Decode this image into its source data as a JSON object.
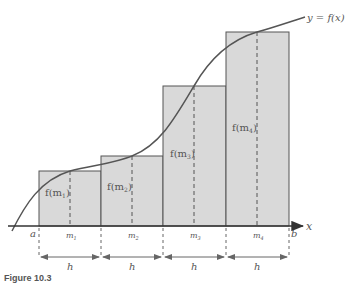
{
  "diagram": {
    "curve_label": "y = f(x)",
    "axis": {
      "x_label": "x",
      "left_endpoint": "a",
      "right_endpoint": "b"
    },
    "rectangles": [
      {
        "height_label": "f(m",
        "sub": "1",
        "midpoint_label": "m",
        "midpoint_sub": "1",
        "x0": 39,
        "x1": 101,
        "top": 171
      },
      {
        "height_label": "f(m",
        "sub": "2",
        "midpoint_label": "m",
        "midpoint_sub": "2",
        "x0": 101,
        "x1": 163,
        "top": 156
      },
      {
        "height_label": "f(m",
        "sub": "3",
        "midpoint_label": "m",
        "midpoint_sub": "3",
        "x0": 163,
        "x1": 226,
        "top": 86
      },
      {
        "height_label": "f(m",
        "sub": "4",
        "midpoint_label": "m",
        "midpoint_sub": "4",
        "x0": 226,
        "x1": 289,
        "top": 32
      }
    ],
    "width_label": "h",
    "caption": "Figure 10.3"
  },
  "colors": {
    "rect_fill": "#d9d9d9",
    "stroke": "#555555",
    "background": "#ffffff"
  }
}
